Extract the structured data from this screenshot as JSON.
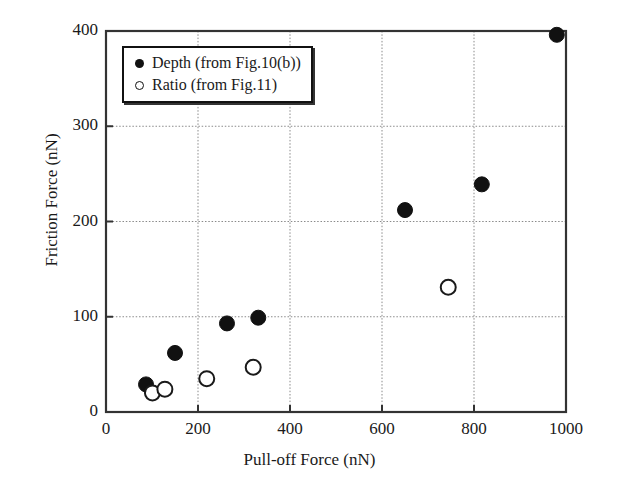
{
  "chart_data": {
    "type": "scatter",
    "title": "",
    "xlabel": "Pull-off Force (nN)",
    "ylabel": "Friction Force (nN)",
    "xlim": [
      0,
      1000
    ],
    "ylim": [
      0,
      400
    ],
    "xticks": [
      0,
      200,
      400,
      600,
      800,
      1000
    ],
    "yticks": [
      0,
      100,
      200,
      300,
      400
    ],
    "xtick_labels": [
      "0",
      "200",
      "400",
      "600",
      "800",
      "1000"
    ],
    "ytick_labels": [
      "0",
      "100",
      "200",
      "300",
      "400"
    ],
    "grid": true,
    "grid_style": "dotted",
    "legend_position": "top-left",
    "marker_color": "#111111",
    "series": [
      {
        "name": "Depth (from Fig.10(b))",
        "marker": "filled-circle",
        "points": [
          {
            "x": 87,
            "y": 29
          },
          {
            "x": 150,
            "y": 62
          },
          {
            "x": 263,
            "y": 93
          },
          {
            "x": 331,
            "y": 99
          },
          {
            "x": 650,
            "y": 212
          },
          {
            "x": 817,
            "y": 239
          },
          {
            "x": 980,
            "y": 396
          }
        ]
      },
      {
        "name": "Ratio (from Fig.11)",
        "marker": "open-circle",
        "points": [
          {
            "x": 101,
            "y": 20
          },
          {
            "x": 128,
            "y": 24
          },
          {
            "x": 219,
            "y": 35
          },
          {
            "x": 320,
            "y": 47
          },
          {
            "x": 744,
            "y": 131
          }
        ]
      }
    ]
  },
  "legend": {
    "items": [
      {
        "marker": "filled-circle",
        "label": "Depth (from Fig.10(b))"
      },
      {
        "marker": "open-circle",
        "label": "Ratio (from Fig.11)"
      }
    ]
  },
  "axes": {
    "x_title": "Pull-off Force (nN)",
    "y_title": "Friction Force (nN)",
    "x_labels": [
      "0",
      "200",
      "400",
      "600",
      "800",
      "1000"
    ],
    "y_labels": [
      "0",
      "100",
      "200",
      "300",
      "400"
    ]
  }
}
